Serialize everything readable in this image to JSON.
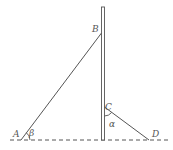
{
  "diagram": {
    "labels": {
      "A": "A",
      "B": "B",
      "C": "C",
      "D": "D",
      "alpha": "α",
      "beta": "β"
    },
    "colors": {
      "stroke": "#555555",
      "background": "#ffffff"
    },
    "elements": {
      "pole": "vertical pole with double line",
      "ground": "dashed horizontal ground line",
      "segment_AB": "line from A on ground to B on pole",
      "segment_CD": "line from C on pole to D on ground",
      "angle_beta": "angle at A between ground and AB",
      "angle_alpha": "angle at C between pole and CD"
    }
  }
}
